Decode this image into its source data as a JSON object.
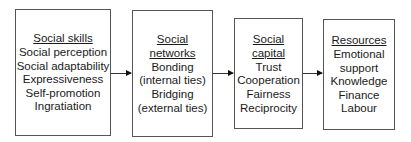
{
  "diagram": {
    "boxes": [
      {
        "id": "social-skills",
        "title": "Social skills",
        "items": [
          "Social perception",
          "Social adaptability",
          "Expressiveness",
          "Self-promotion",
          "Ingratiation"
        ]
      },
      {
        "id": "social-networks",
        "title": "Social networks",
        "items": [
          "Bonding",
          "(internal ties)",
          "Bridging",
          "(external ties)"
        ]
      },
      {
        "id": "social-capital",
        "title": "Social capital",
        "items": [
          "Trust",
          "Cooperation",
          "Fairness",
          "Reciprocity"
        ]
      },
      {
        "id": "resources",
        "title": "Resources",
        "items": [
          "Emotional",
          "support",
          "Knowledge",
          "Finance",
          "Labour"
        ]
      }
    ],
    "arrows": [
      {
        "from": "social-skills",
        "to": "social-networks"
      },
      {
        "from": "social-networks",
        "to": "social-capital"
      },
      {
        "from": "social-capital",
        "to": "resources"
      }
    ]
  }
}
